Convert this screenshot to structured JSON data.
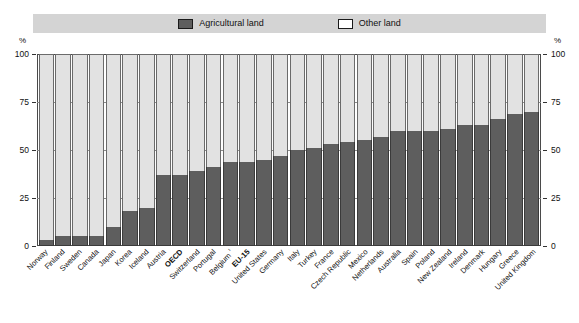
{
  "legend": {
    "items": [
      {
        "label": "Agricultural land",
        "color": "#5e5e5e",
        "swatch": "filled-square-icon"
      },
      {
        "label": "Other land",
        "color": "#ffffff",
        "swatch": "empty-square-icon"
      }
    ]
  },
  "axis": {
    "unit_left": "%",
    "unit_right": "%",
    "ticks": [
      "100",
      "75",
      "50",
      "25",
      "0"
    ]
  },
  "chart_data": {
    "type": "bar",
    "title": "",
    "subtitle": "",
    "xlabel": "",
    "ylabel": "%",
    "ylim": [
      0,
      100
    ],
    "yticks": [
      0,
      25,
      50,
      75,
      100
    ],
    "grid": true,
    "stacked": true,
    "legend_position": "top",
    "categories": [
      "Norway",
      "Finland",
      "Sweden",
      "Canada",
      "Japan",
      "Korea",
      "Iceland",
      "Austria",
      "OECD",
      "Switzerland",
      "Portugal",
      "Belgium ¹",
      "EU-15",
      "United States",
      "Germany",
      "Italy",
      "Turkey",
      "France",
      "Czech Republic",
      "Mexico",
      "Netherlands",
      "Australia",
      "Spain",
      "Poland",
      "New Zealand",
      "Ireland",
      "Denmark",
      "Hungary",
      "Greece",
      "United Kingdom"
    ],
    "highlighted_categories": [
      "OECD",
      "EU-15"
    ],
    "series": [
      {
        "name": "Agricultural land",
        "color": "#5e5e5e",
        "values": [
          3,
          5,
          5,
          5,
          10,
          18,
          20,
          37,
          37,
          39,
          41,
          44,
          44,
          45,
          47,
          50,
          51,
          53,
          54,
          55,
          57,
          60,
          60,
          60,
          61,
          63,
          63,
          66,
          69,
          70
        ]
      },
      {
        "name": "Other land",
        "color": "#e2e2e2",
        "values": [
          97,
          95,
          95,
          95,
          90,
          82,
          80,
          63,
          63,
          61,
          59,
          56,
          56,
          55,
          53,
          50,
          49,
          47,
          46,
          45,
          43,
          40,
          40,
          40,
          39,
          37,
          37,
          34,
          31,
          30
        ]
      }
    ]
  }
}
